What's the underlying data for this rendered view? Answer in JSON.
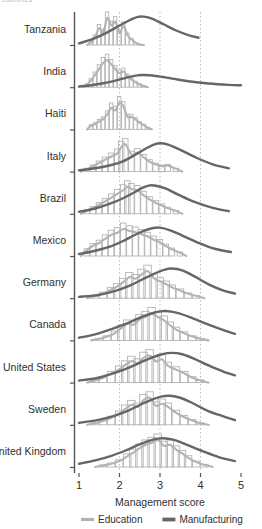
{
  "figure": {
    "cut_off_header": "countries",
    "legend_position": "bottom-center",
    "grid": "vertical dotted gridlines at 2, 3, 4"
  },
  "colors": {
    "education": "#b3b3b3",
    "manufacturing": "#666666",
    "axis": "#555555",
    "gridline": "#bdbdbd",
    "text": "#2f2f2f"
  },
  "chart_data": {
    "type": "area",
    "title": "",
    "subtitle": "",
    "xlabel": "Management score",
    "ylabel": "",
    "xlim": [
      1,
      5
    ],
    "xticks": [
      1,
      2,
      3,
      4
    ],
    "xtick_labels": [
      "1",
      "2",
      "3",
      "4",
      "5"
    ],
    "xticks_all": [
      1,
      2,
      3,
      4,
      5
    ],
    "gridlines_x": [
      2,
      3,
      4
    ],
    "legend": [
      {
        "name": "Education",
        "color": "#b3b3b3",
        "style": "histogram"
      },
      {
        "name": "Manufacturing",
        "color": "#666666",
        "style": "line"
      }
    ],
    "categories": [
      "Tanzania",
      "India",
      "Haiti",
      "Italy",
      "Brazil",
      "Mexico",
      "Germany",
      "Canada",
      "United States",
      "Sweden",
      "United Kingdom"
    ],
    "series": [
      {
        "name": "Education",
        "color": "#b3b3b3",
        "rows": [
          {
            "category": "Tanzania",
            "peak_x": 1.85,
            "x": [
              1.3,
              1.4,
              1.5,
              1.6,
              1.7,
              1.8,
              1.9,
              2.0,
              2.1,
              2.2,
              2.3,
              2.4,
              2.5
            ],
            "values": [
              0.1,
              0.3,
              0.62,
              0.48,
              1.0,
              0.72,
              0.86,
              0.44,
              0.7,
              0.36,
              0.2,
              0.08,
              0.02
            ]
          },
          {
            "category": "India",
            "peak_x": 1.75,
            "x": [
              1.2,
              1.3,
              1.4,
              1.5,
              1.6,
              1.7,
              1.8,
              1.9,
              2.0,
              2.1,
              2.2,
              2.3,
              2.4,
              2.5,
              2.6
            ],
            "values": [
              0.1,
              0.26,
              0.46,
              0.68,
              0.9,
              1.0,
              0.84,
              0.66,
              0.52,
              0.58,
              0.4,
              0.28,
              0.18,
              0.1,
              0.04
            ]
          },
          {
            "category": "Haiti",
            "peak_x": 2.0,
            "x": [
              1.3,
              1.4,
              1.5,
              1.6,
              1.7,
              1.8,
              1.9,
              2.0,
              2.1,
              2.2,
              2.3,
              2.4,
              2.5,
              2.6,
              2.7
            ],
            "values": [
              0.14,
              0.2,
              0.3,
              0.38,
              0.56,
              0.8,
              0.7,
              1.0,
              0.84,
              0.46,
              0.46,
              0.36,
              0.24,
              0.16,
              0.06
            ]
          },
          {
            "category": "Italy",
            "peak_x": 2.12,
            "x": [
              1.2,
              1.35,
              1.5,
              1.65,
              1.8,
              1.95,
              2.05,
              2.15,
              2.3,
              2.45,
              2.6,
              2.75,
              2.9,
              3.05,
              3.2,
              3.4
            ],
            "values": [
              0.1,
              0.2,
              0.32,
              0.44,
              0.56,
              0.68,
              0.92,
              1.0,
              0.62,
              0.7,
              0.52,
              0.36,
              0.26,
              0.2,
              0.22,
              0.1
            ]
          },
          {
            "category": "Brazil",
            "peak_x": 2.25,
            "x": [
              1.2,
              1.35,
              1.5,
              1.65,
              1.8,
              1.95,
              2.1,
              2.2,
              2.3,
              2.45,
              2.6,
              2.75,
              2.9,
              3.05,
              3.2,
              3.4
            ],
            "values": [
              0.12,
              0.22,
              0.34,
              0.46,
              0.6,
              0.74,
              0.88,
              1.0,
              0.92,
              0.86,
              0.68,
              0.52,
              0.4,
              0.3,
              0.2,
              0.1
            ]
          },
          {
            "category": "Mexico",
            "peak_x": 2.35,
            "x": [
              1.2,
              1.35,
              1.5,
              1.65,
              1.8,
              1.95,
              2.1,
              2.25,
              2.4,
              2.55,
              2.7,
              2.85,
              3.0,
              3.15,
              3.3,
              3.5
            ],
            "values": [
              0.22,
              0.38,
              0.48,
              0.64,
              0.78,
              0.86,
              1.0,
              0.92,
              0.88,
              0.8,
              0.72,
              0.6,
              0.5,
              0.36,
              0.24,
              0.12
            ]
          },
          {
            "category": "Germany",
            "peak_x": 2.7,
            "x": [
              1.4,
              1.6,
              1.8,
              1.95,
              2.1,
              2.25,
              2.4,
              2.55,
              2.7,
              2.85,
              3.0,
              3.15,
              3.3,
              3.5,
              3.7,
              3.9
            ],
            "values": [
              0.08,
              0.18,
              0.32,
              0.44,
              0.6,
              0.78,
              0.72,
              0.88,
              1.0,
              0.74,
              0.62,
              0.52,
              0.4,
              0.28,
              0.16,
              0.08
            ]
          },
          {
            "category": "Canada",
            "peak_x": 2.85,
            "x": [
              1.5,
              1.7,
              1.9,
              2.05,
              2.2,
              2.35,
              2.5,
              2.65,
              2.8,
              2.95,
              3.1,
              3.25,
              3.4,
              3.6,
              3.8,
              4.0
            ],
            "values": [
              0.06,
              0.14,
              0.28,
              0.46,
              0.62,
              0.58,
              0.78,
              0.88,
              1.0,
              0.86,
              0.74,
              0.56,
              0.4,
              0.26,
              0.14,
              0.06
            ]
          },
          {
            "category": "United States",
            "peak_x": 2.75,
            "x": [
              1.4,
              1.6,
              1.8,
              2.0,
              2.15,
              2.3,
              2.45,
              2.6,
              2.75,
              2.9,
              3.05,
              3.2,
              3.4,
              3.6,
              3.8,
              4.0
            ],
            "values": [
              0.08,
              0.18,
              0.34,
              0.5,
              0.66,
              0.8,
              0.72,
              0.92,
              1.0,
              0.78,
              0.86,
              0.62,
              0.48,
              0.34,
              0.18,
              0.08
            ]
          },
          {
            "category": "Sweden",
            "peak_x": 2.8,
            "x": [
              1.4,
              1.6,
              1.8,
              2.0,
              2.15,
              2.3,
              2.45,
              2.6,
              2.75,
              2.9,
              3.05,
              3.2,
              3.4,
              3.6,
              3.8,
              4.0
            ],
            "values": [
              0.06,
              0.14,
              0.26,
              0.42,
              0.6,
              0.74,
              0.66,
              0.92,
              1.0,
              0.7,
              0.78,
              0.66,
              0.44,
              0.28,
              0.16,
              0.06
            ]
          },
          {
            "category": "United Kingdom",
            "peak_x": 3.0,
            "x": [
              1.6,
              1.8,
              2.0,
              2.2,
              2.35,
              2.5,
              2.65,
              2.8,
              2.95,
              3.1,
              3.25,
              3.4,
              3.55,
              3.7,
              3.9,
              4.1
            ],
            "values": [
              0.06,
              0.12,
              0.22,
              0.4,
              0.54,
              0.7,
              0.82,
              0.9,
              1.0,
              0.78,
              0.82,
              0.64,
              0.5,
              0.34,
              0.18,
              0.08
            ]
          }
        ]
      },
      {
        "name": "Manufacturing",
        "color": "#666666",
        "rows": [
          {
            "category": "Tanzania",
            "peak_x": 2.55,
            "x": [
              1.0,
              1.3,
              1.6,
              1.9,
              2.2,
              2.45,
              2.6,
              2.8,
              3.1,
              3.4,
              3.7,
              3.95
            ],
            "values": [
              0.05,
              0.16,
              0.32,
              0.52,
              0.72,
              0.85,
              0.86,
              0.8,
              0.62,
              0.44,
              0.3,
              0.22
            ]
          },
          {
            "category": "India",
            "peak_x": 2.55,
            "x": [
              1.0,
              1.3,
              1.6,
              1.9,
              2.2,
              2.45,
              2.6,
              2.9,
              3.3,
              3.7,
              4.2,
              4.7,
              5.0
            ],
            "values": [
              0.02,
              0.06,
              0.12,
              0.2,
              0.3,
              0.36,
              0.37,
              0.34,
              0.26,
              0.18,
              0.11,
              0.07,
              0.06
            ]
          },
          {
            "category": "Haiti",
            "peak_x": null,
            "x": [],
            "values": []
          },
          {
            "category": "Italy",
            "peak_x": 3.0,
            "x": [
              1.0,
              1.4,
              1.8,
              2.1,
              2.4,
              2.65,
              2.85,
              3.0,
              3.2,
              3.5,
              3.9,
              4.3,
              4.7
            ],
            "values": [
              0.04,
              0.1,
              0.2,
              0.32,
              0.52,
              0.7,
              0.82,
              0.86,
              0.82,
              0.66,
              0.42,
              0.22,
              0.1
            ]
          },
          {
            "category": "Brazil",
            "peak_x": 2.8,
            "x": [
              1.0,
              1.4,
              1.8,
              2.1,
              2.35,
              2.55,
              2.75,
              2.9,
              3.15,
              3.45,
              3.85,
              4.3,
              4.7
            ],
            "values": [
              0.06,
              0.16,
              0.32,
              0.48,
              0.64,
              0.78,
              0.86,
              0.85,
              0.76,
              0.58,
              0.36,
              0.18,
              0.08
            ]
          },
          {
            "category": "Mexico",
            "peak_x": 2.85,
            "x": [
              1.0,
              1.4,
              1.8,
              2.1,
              2.35,
              2.6,
              2.8,
              3.0,
              3.25,
              3.55,
              3.95,
              4.35,
              4.75
            ],
            "values": [
              0.06,
              0.16,
              0.3,
              0.46,
              0.62,
              0.76,
              0.84,
              0.86,
              0.78,
              0.62,
              0.4,
              0.22,
              0.12
            ]
          },
          {
            "category": "Germany",
            "peak_x": 3.3,
            "x": [
              1.0,
              1.5,
              1.9,
              2.25,
              2.55,
              2.85,
              3.1,
              3.3,
              3.55,
              3.85,
              4.2,
              4.55,
              4.85
            ],
            "values": [
              0.04,
              0.1,
              0.22,
              0.38,
              0.56,
              0.74,
              0.86,
              0.9,
              0.84,
              0.66,
              0.42,
              0.24,
              0.14
            ]
          },
          {
            "category": "Canada",
            "peak_x": 3.1,
            "x": [
              1.0,
              1.4,
              1.8,
              2.15,
              2.45,
              2.75,
              3.0,
              3.15,
              3.4,
              3.75,
              4.15,
              4.55,
              4.85
            ],
            "values": [
              0.08,
              0.18,
              0.34,
              0.5,
              0.66,
              0.8,
              0.88,
              0.89,
              0.84,
              0.7,
              0.5,
              0.32,
              0.2
            ]
          },
          {
            "category": "United States",
            "peak_x": 3.3,
            "x": [
              1.0,
              1.45,
              1.85,
              2.2,
              2.5,
              2.8,
              3.05,
              3.3,
              3.55,
              3.85,
              4.2,
              4.55,
              4.85
            ],
            "values": [
              0.06,
              0.14,
              0.28,
              0.44,
              0.6,
              0.76,
              0.86,
              0.9,
              0.86,
              0.72,
              0.52,
              0.34,
              0.22
            ]
          },
          {
            "category": "Sweden",
            "peak_x": 3.25,
            "x": [
              1.0,
              1.45,
              1.85,
              2.2,
              2.5,
              2.8,
              3.05,
              3.25,
              3.5,
              3.8,
              4.15,
              4.55,
              4.85
            ],
            "values": [
              0.06,
              0.14,
              0.26,
              0.42,
              0.6,
              0.76,
              0.86,
              0.88,
              0.82,
              0.66,
              0.44,
              0.26,
              0.14
            ]
          },
          {
            "category": "United Kingdom",
            "peak_x": 3.05,
            "x": [
              1.0,
              1.4,
              1.8,
              2.15,
              2.45,
              2.75,
              2.95,
              3.1,
              3.35,
              3.65,
              4.05,
              4.45,
              4.85
            ],
            "values": [
              0.1,
              0.2,
              0.34,
              0.5,
              0.66,
              0.8,
              0.86,
              0.87,
              0.82,
              0.68,
              0.48,
              0.3,
              0.18
            ]
          }
        ]
      }
    ]
  }
}
